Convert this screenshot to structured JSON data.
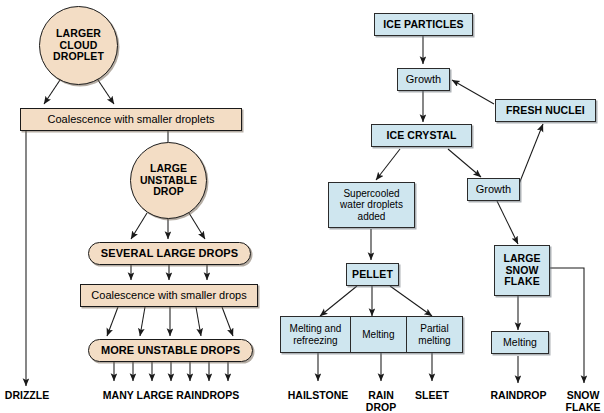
{
  "diagram": {
    "colors": {
      "warm_fill": "#f3ddc5",
      "cold_fill": "#cfe6ef",
      "stroke": "#1a1a1a",
      "background": "#ffffff"
    }
  },
  "warm_process": {
    "larger_cloud_droplet": "LARGER\nCLOUD\nDROPLET",
    "coalescence_smaller_droplets": "Coalescence with smaller droplets",
    "large_unstable_drop": "LARGE\nUNSTABLE\nDROP",
    "several_large_drops": "SEVERAL LARGE DROPS",
    "coalescence_smaller_drops": "Coalescence with smaller drops",
    "more_unstable_drops": "MORE UNSTABLE DROPS",
    "drizzle": "DRIZZLE",
    "many_large_raindrops": "MANY LARGE RAINDROPS"
  },
  "cold_process": {
    "ice_particles": "ICE PARTICLES",
    "growth_1": "Growth",
    "fresh_nuclei": "FRESH NUCLEI",
    "ice_crystal": "ICE CRYSTAL",
    "supercooled": "Supercooled\nwater droplets\nadded",
    "growth_2": "Growth",
    "pellet": "PELLET",
    "large_snow_flake": "LARGE\nSNOW\nFLAKE",
    "melting_and_refreezing": "Melting and\nrefreezing",
    "melting_mid": "Melting",
    "partial_melting": "Partial\nmelting",
    "melting_right": "Melting",
    "hailstone": "HAILSTONE",
    "rain_drop": "RAIN\nDROP",
    "sleet": "SLEET",
    "raindrop": "RAINDROP",
    "snow_flake": "SNOW\nFLAKE"
  }
}
